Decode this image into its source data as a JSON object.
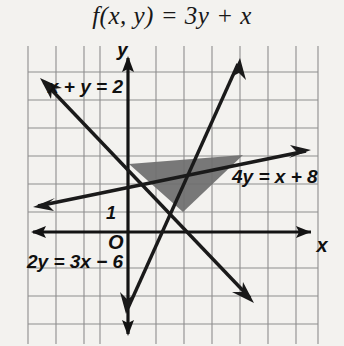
{
  "title": {
    "text": "f(x, y) = 3y + x"
  },
  "graph": {
    "axis_labels": {
      "x": "x",
      "y": "y",
      "origin": "O"
    },
    "tick_labels": [
      {
        "name": "y-tick-1",
        "text": "1",
        "x": 118,
        "y": 168
      }
    ],
    "line_labels": [
      {
        "name": "line-label-x-plus-y",
        "text": "x + y = 2",
        "x": 48,
        "y": 47
      },
      {
        "name": "line-label-4y",
        "text": "4y = x + 8",
        "x": 232,
        "y": 137
      },
      {
        "name": "line-label-2y",
        "text": "2y = 3x − 6",
        "x": 27,
        "y": 222
      }
    ],
    "lines": [
      {
        "name": "line-x-plus-y-2",
        "equation": "x + y = 2"
      },
      {
        "name": "line-4y-x-plus-8",
        "equation": "4y = x + 8"
      },
      {
        "name": "line-2y-3x-minus-6",
        "equation": "2y = 3x - 6"
      }
    ],
    "shaded_region": {
      "name": "feasible-region",
      "vertices": [
        [
          128,
          118
        ],
        [
          243,
          109
        ],
        [
          183,
          166
        ]
      ],
      "fill": "#6e6e6e"
    },
    "colors": {
      "grid": "#8c8c8c",
      "axis": "#141414",
      "line": "#1a1a1a",
      "background": "#f3f2ef",
      "text": "#101010"
    },
    "grid": {
      "spacing": 28,
      "x_origin": 128,
      "y_origin": 186,
      "left": 28,
      "right": 318,
      "top": 0,
      "bottom": 298
    }
  }
}
